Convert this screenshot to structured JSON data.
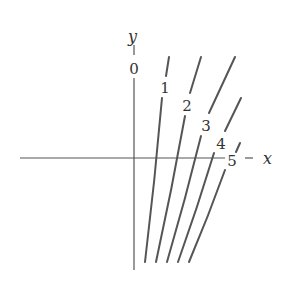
{
  "diagram": {
    "axes": {
      "x_label": "x",
      "y_label": "y",
      "x_axis": {
        "x1": 20,
        "x2": 225,
        "y": 158
      },
      "x_axis_tail": {
        "x1": 245,
        "x2": 253,
        "y": 158
      },
      "y_axis": {
        "x": 134,
        "y1": 78,
        "y2": 270
      },
      "y_axis_tick_top": {
        "x": 134,
        "y1": 45,
        "y2": 55
      }
    },
    "curves": [
      {
        "label": "0",
        "label_pos": [
          134,
          74
        ],
        "segments": [
          [
            [
              134,
              78
            ],
            [
              134,
              270
            ]
          ]
        ]
      },
      {
        "label": "1",
        "label_pos": [
          165,
          93
        ],
        "segments": [
          [
            [
              169,
              57
            ],
            [
              166,
              76
            ]
          ],
          [
            [
              162,
              98
            ],
            [
              145,
              262
            ]
          ]
        ]
      },
      {
        "label": "2",
        "label_pos": [
          187,
          111
        ],
        "segments": [
          [
            [
              201,
              57
            ],
            [
              190,
              93
            ]
          ],
          [
            [
              185,
              116
            ],
            [
              156,
              262
            ]
          ]
        ]
      },
      {
        "label": "3",
        "label_pos": [
          206,
          131
        ],
        "segments": [
          [
            [
              235,
              57
            ],
            [
              209,
              113
            ]
          ],
          [
            [
              201,
              136
            ],
            [
              167,
              262
            ]
          ]
        ]
      },
      {
        "label": "4",
        "label_pos": [
          221,
          149
        ],
        "segments": [
          [
            [
              241,
              98
            ],
            [
              225,
              131
            ]
          ],
          [
            [
              214,
              153
            ],
            [
              178,
              262
            ]
          ]
        ]
      },
      {
        "label": "5",
        "label_pos": [
          232,
          166
        ],
        "segments": [
          [
            [
              240,
              143
            ],
            [
              236,
              152
            ]
          ],
          [
            [
              225,
              170
            ],
            [
              189,
              262
            ]
          ]
        ]
      }
    ]
  }
}
